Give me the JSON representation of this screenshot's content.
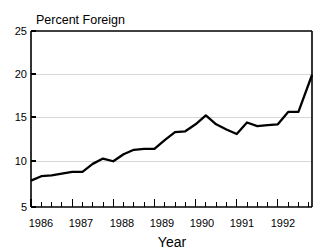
{
  "chart_data": {
    "type": "line",
    "title": "Percent Foreign",
    "xlabel": "Year",
    "ylabel": "",
    "xlim": [
      1986.0,
      1992.83
    ],
    "ylim": [
      5,
      25
    ],
    "grid": true,
    "legend": false,
    "ytick_labels": [
      "5",
      "10",
      "15",
      "20",
      "25"
    ],
    "ytick_values": [
      5,
      10,
      15,
      20,
      25
    ],
    "xtick_labels": [
      "1986",
      "1987",
      "1988",
      "1989",
      "1990",
      "1991",
      "1992"
    ],
    "xtick_values": [
      1986,
      1987,
      1988,
      1989,
      1990,
      1991,
      1992
    ],
    "minor_ticks_per_year": 4,
    "line_color": "#000000",
    "grid_color": "#d7d7d7",
    "series": [
      {
        "name": "Percent Foreign",
        "x": [
          1986.0,
          1986.25,
          1986.5,
          1986.75,
          1987.0,
          1987.25,
          1987.5,
          1987.75,
          1988.0,
          1988.25,
          1988.5,
          1988.75,
          1989.0,
          1989.25,
          1989.5,
          1989.75,
          1990.0,
          1990.25,
          1990.5,
          1990.75,
          1991.0,
          1991.25,
          1991.5,
          1991.75,
          1992.0,
          1992.25,
          1992.5,
          1992.83
        ],
        "values": [
          8.0,
          8.5,
          8.6,
          8.8,
          9.0,
          9.0,
          9.9,
          10.5,
          10.2,
          11.0,
          11.5,
          11.6,
          11.6,
          12.6,
          13.5,
          13.6,
          14.4,
          15.4,
          14.4,
          13.8,
          13.3,
          14.6,
          14.2,
          14.3,
          14.4,
          15.8,
          15.8,
          20.0
        ]
      }
    ]
  },
  "axes": {
    "title": "Percent Foreign",
    "xlabel": "Year"
  }
}
